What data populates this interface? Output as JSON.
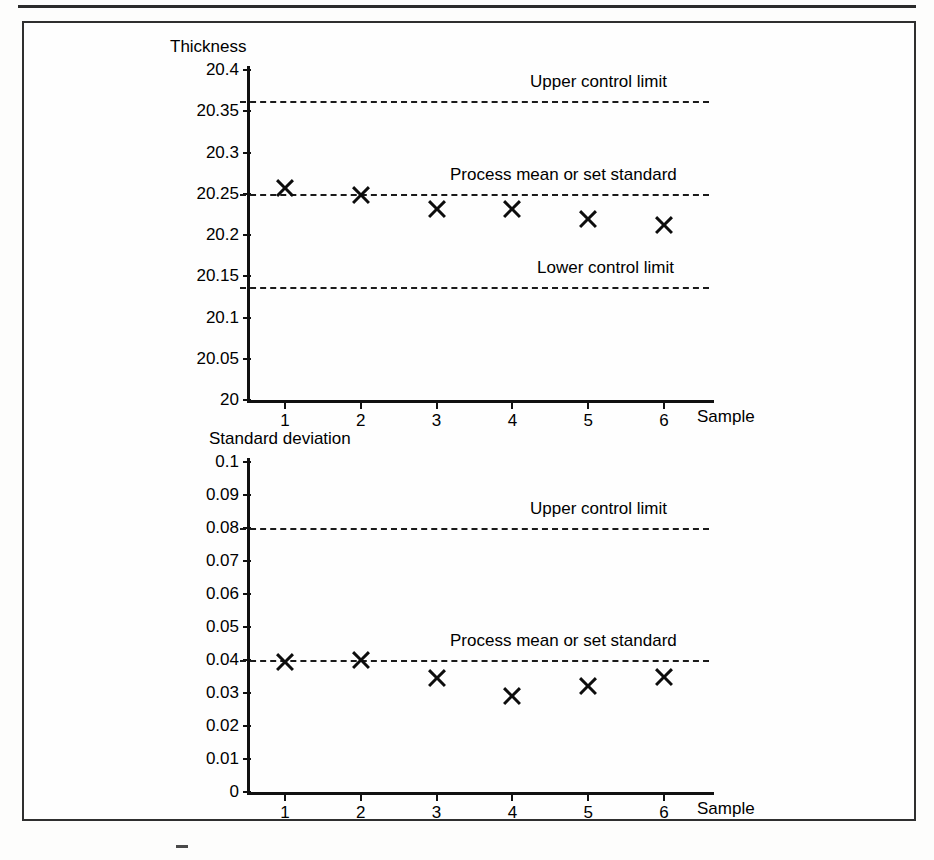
{
  "figure": {
    "top_rule": true,
    "border_color": "#2f2f2f"
  },
  "charts": [
    {
      "id": "thickness-chart",
      "y_axis_title": "Thickness",
      "x_axis_title": "Sample",
      "y_ticks": [
        "20.4",
        "20.35",
        "20.3",
        "20.25",
        "20.2",
        "20.15",
        "20.1",
        "20.05",
        "20"
      ],
      "x_ticks": [
        "1",
        "2",
        "3",
        "4",
        "5",
        "6"
      ],
      "lines": [
        {
          "label": "Upper control limit",
          "value": 20.362
        },
        {
          "label": "Process mean or set standard",
          "value": 20.25
        },
        {
          "label": "Lower control limit",
          "value": 20.137
        }
      ]
    },
    {
      "id": "stddev-chart",
      "y_axis_title": "Standard deviation",
      "x_axis_title": "Sample",
      "y_ticks": [
        "0.1",
        "0.09",
        "0.08",
        "0.07",
        "0.06",
        "0.05",
        "0.04",
        "0.03",
        "0.02",
        "0.01",
        "0"
      ],
      "x_ticks": [
        "1",
        "2",
        "3",
        "4",
        "5",
        "6"
      ],
      "lines": [
        {
          "label": "Upper control limit",
          "value": 0.08
        },
        {
          "label": "Process mean or set standard",
          "value": 0.04
        }
      ]
    }
  ],
  "chart_data": [
    {
      "type": "scatter",
      "id": "thickness-chart",
      "title": "",
      "xlabel": "Sample",
      "ylabel": "Thickness",
      "x": [
        1,
        2,
        3,
        4,
        5,
        6
      ],
      "categories": [
        "1",
        "2",
        "3",
        "4",
        "5",
        "6"
      ],
      "values": [
        20.257,
        20.248,
        20.232,
        20.231,
        20.22,
        20.212
      ],
      "series": [
        {
          "name": "Sample mean thickness",
          "values": [
            20.257,
            20.248,
            20.232,
            20.231,
            20.22,
            20.212
          ]
        }
      ],
      "xlim": [
        0.5,
        6.5
      ],
      "ylim": [
        20.0,
        20.4
      ],
      "ytick_step": 0.05,
      "yticks": [
        20.0,
        20.05,
        20.1,
        20.15,
        20.2,
        20.25,
        20.3,
        20.35,
        20.4
      ],
      "xticks": [
        1,
        2,
        3,
        4,
        5,
        6
      ],
      "grid": false,
      "legend": "none",
      "marker": "x-bold",
      "annotations": [
        {
          "text": "Upper control limit",
          "type": "hline",
          "y": 20.362,
          "style": "dash-dot"
        },
        {
          "text": "Process mean or set standard",
          "type": "hline",
          "y": 20.25,
          "style": "dash-dot"
        },
        {
          "text": "Lower control limit",
          "type": "hline",
          "y": 20.137,
          "style": "dash-dot"
        }
      ]
    },
    {
      "type": "scatter",
      "id": "stddev-chart",
      "title": "",
      "xlabel": "Sample",
      "ylabel": "Standard deviation",
      "x": [
        1,
        2,
        3,
        4,
        5,
        6
      ],
      "categories": [
        "1",
        "2",
        "3",
        "4",
        "5",
        "6"
      ],
      "values": [
        0.0395,
        0.04,
        0.0345,
        0.029,
        0.032,
        0.035
      ],
      "series": [
        {
          "name": "Sample standard deviation",
          "values": [
            0.0395,
            0.04,
            0.0345,
            0.029,
            0.032,
            0.035
          ]
        }
      ],
      "xlim": [
        0.5,
        6.5
      ],
      "ylim": [
        0.0,
        0.1
      ],
      "ytick_step": 0.01,
      "yticks": [
        0.0,
        0.01,
        0.02,
        0.03,
        0.04,
        0.05,
        0.06,
        0.07,
        0.08,
        0.09,
        0.1
      ],
      "xticks": [
        1,
        2,
        3,
        4,
        5,
        6
      ],
      "grid": false,
      "legend": "none",
      "marker": "x-bold",
      "annotations": [
        {
          "text": "Upper control limit",
          "type": "hline",
          "y": 0.08,
          "style": "dash-dot"
        },
        {
          "text": "Process mean or set standard",
          "type": "hline",
          "y": 0.04,
          "style": "dash-dot"
        }
      ]
    }
  ]
}
